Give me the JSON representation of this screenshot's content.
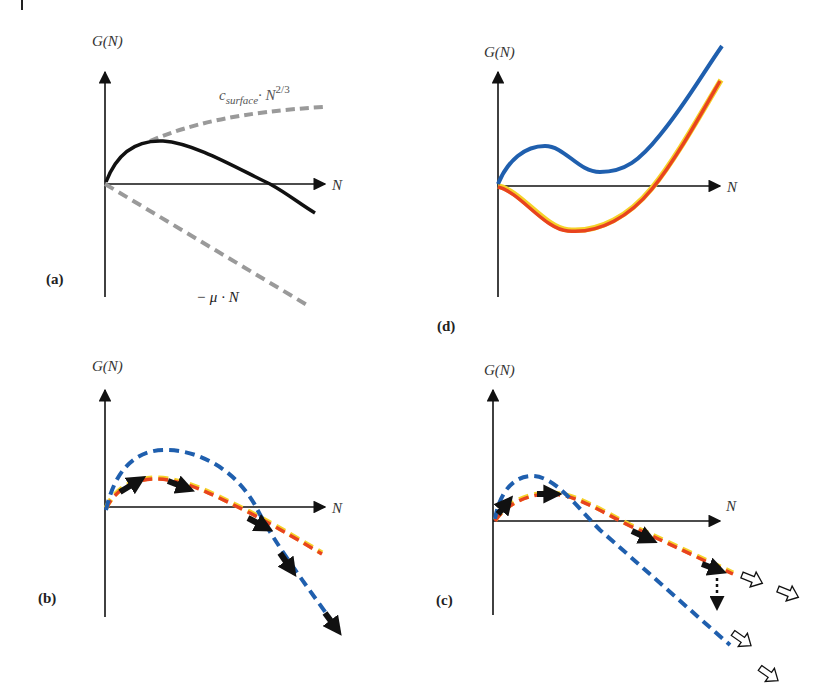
{
  "figure": {
    "corner_mark": "|",
    "panels": [
      {
        "id": "a",
        "label": "(a)",
        "y_axis_label": "G(N)",
        "x_axis_label": "N",
        "annotations": {
          "surface_term_prefix": "c",
          "surface_term_subscript": "surface",
          "surface_term_mid": "· N",
          "surface_term_superscript": "2/3",
          "volume_term": "− μ · N"
        },
        "curves": [
          {
            "name": "surface term",
            "style": "dashed",
            "color": "#9a9a9a"
          },
          {
            "name": "volume term",
            "style": "dashed",
            "color": "#9a9a9a"
          },
          {
            "name": "total G(N)",
            "style": "solid",
            "color": "#111111"
          }
        ]
      },
      {
        "id": "d",
        "label": "(d)",
        "y_axis_label": "G(N)",
        "x_axis_label": "N",
        "curves": [
          {
            "name": "blue curve (local max then min, rises)",
            "style": "solid",
            "color": "#1f5fae"
          },
          {
            "name": "red curve (dips below zero, rises)",
            "style": "solid",
            "color": "#e8431f"
          }
        ]
      },
      {
        "id": "b",
        "label": "(b)",
        "y_axis_label": "G(N)",
        "x_axis_label": "N",
        "curves": [
          {
            "name": "blue dashed barrier",
            "style": "dashed",
            "color": "#1f5fae"
          },
          {
            "name": "red dashed barrier",
            "style": "dashed",
            "color": "#e8431f"
          }
        ],
        "arrows": "black filled arrows tracing path from red to blue curve"
      },
      {
        "id": "c",
        "label": "(c)",
        "y_axis_label": "G(N)",
        "x_axis_label": "N",
        "curves": [
          {
            "name": "blue dashed barrier",
            "style": "dashed",
            "color": "#1f5fae"
          },
          {
            "name": "red dashed barrier",
            "style": "dashed",
            "color": "#e8431f"
          }
        ],
        "arrows": "black filled arrows along red curve, dotted vertical arrow down to blue, open arrows continuing both"
      }
    ]
  },
  "colors": {
    "axis": "#111111",
    "gray_dash": "#9a9a9a",
    "black_curve": "#111111",
    "blue": "#1f5fae",
    "red": "#e8431f",
    "yellow_edge": "#f5d22a"
  }
}
